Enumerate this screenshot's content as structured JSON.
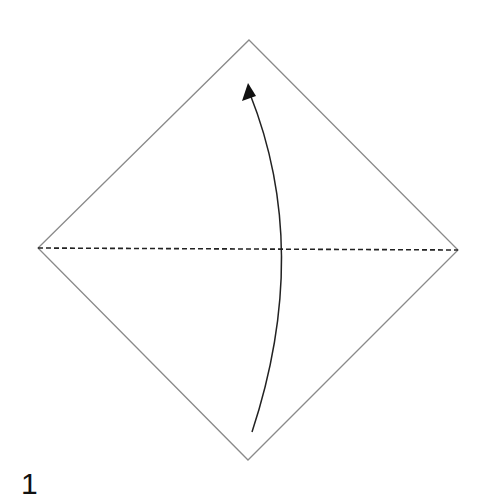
{
  "diagram": {
    "step_number": "1",
    "colors": {
      "paper_edge": "#8a8a8a",
      "valley_fold": "#222222",
      "arrow": "#222222",
      "background": "#ffffff",
      "text": "#111111"
    },
    "paper": {
      "shape": "square-diamond",
      "vertices": {
        "top": [
          249,
          40
        ],
        "right": [
          458,
          250
        ],
        "bottom": [
          248,
          460
        ],
        "left": [
          38,
          248
        ]
      }
    },
    "fold_line": {
      "type": "valley-fold-dashed",
      "from": [
        38,
        248
      ],
      "to": [
        458,
        250
      ]
    },
    "arrow": {
      "type": "fold-direction-curved",
      "icon": "curved-arrow-up-icon",
      "start": [
        252,
        432
      ],
      "control": [
        312,
        250
      ],
      "end": [
        250,
        92
      ],
      "head_tip": [
        248,
        84
      ]
    }
  }
}
